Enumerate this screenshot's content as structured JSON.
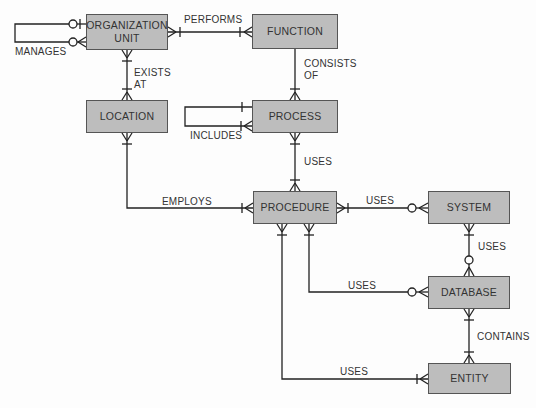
{
  "diagram": {
    "type": "entity-relationship",
    "entities": {
      "org_unit": {
        "label_line1": "ORGANIZATION",
        "label_line2": "UNIT"
      },
      "function": {
        "label": "FUNCTION"
      },
      "location": {
        "label": "LOCATION"
      },
      "process": {
        "label": "PROCESS"
      },
      "procedure": {
        "label": "PROCEDURE"
      },
      "system": {
        "label": "SYSTEM"
      },
      "database": {
        "label": "DATABASE"
      },
      "entity": {
        "label": "ENTITY"
      }
    },
    "relationships": {
      "manages": {
        "label": "MANAGES",
        "from": "ORGANIZATION UNIT",
        "to": "ORGANIZATION UNIT"
      },
      "performs": {
        "label": "PERFORMS",
        "from": "ORGANIZATION UNIT",
        "to": "FUNCTION"
      },
      "exists_at": {
        "label_line1": "EXISTS",
        "label_line2": "AT",
        "from": "ORGANIZATION UNIT",
        "to": "LOCATION"
      },
      "consists_of": {
        "label_line1": "CONSISTS",
        "label_line2": "OF",
        "from": "FUNCTION",
        "to": "PROCESS"
      },
      "includes": {
        "label": "INCLUDES",
        "from": "PROCESS",
        "to": "PROCESS"
      },
      "process_uses": {
        "label": "USES",
        "from": "PROCESS",
        "to": "PROCEDURE"
      },
      "employs": {
        "label": "EMPLOYS",
        "from": "LOCATION",
        "to": "PROCEDURE"
      },
      "procedure_uses_system": {
        "label": "USES",
        "from": "PROCEDURE",
        "to": "SYSTEM"
      },
      "system_uses_database": {
        "label": "USES",
        "from": "SYSTEM",
        "to": "DATABASE"
      },
      "procedure_uses_database": {
        "label": "USES",
        "from": "PROCEDURE",
        "to": "DATABASE"
      },
      "contains": {
        "label": "CONTAINS",
        "from": "DATABASE",
        "to": "ENTITY"
      },
      "procedure_uses_entity": {
        "label": "USES",
        "from": "PROCEDURE",
        "to": "ENTITY"
      }
    }
  }
}
